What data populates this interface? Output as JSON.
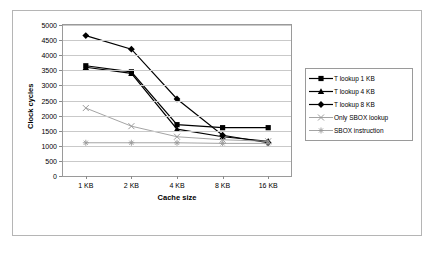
{
  "chart_data": {
    "type": "line",
    "title": "",
    "xlabel": "Cache size",
    "ylabel": "Clock cycles",
    "categories": [
      "1 KB",
      "2 KB",
      "4 KB",
      "8 KB",
      "16 KB"
    ],
    "ylim": [
      0,
      5000
    ],
    "yticks": [
      0,
      500,
      1000,
      1500,
      2000,
      2500,
      3000,
      3500,
      4000,
      4500,
      5000
    ],
    "grid": true,
    "legend_position": "right",
    "series": [
      {
        "name": "T lookup 1 KB",
        "marker": "square",
        "color": "#000000",
        "values": [
          3650,
          3450,
          1700,
          1600,
          1600
        ]
      },
      {
        "name": "T lookup 4 KB",
        "marker": "triangle",
        "color": "#000000",
        "values": [
          3600,
          3400,
          1550,
          1300,
          1150
        ]
      },
      {
        "name": "T lookup 8 KB",
        "marker": "diamond",
        "color": "#000000",
        "values": [
          4650,
          4200,
          2550,
          1350,
          1100
        ]
      },
      {
        "name": "Only SBOX lookup",
        "marker": "cross",
        "color": "#9a9a9a",
        "values": [
          2250,
          1650,
          1300,
          1200,
          1150
        ]
      },
      {
        "name": "SBOX instruction",
        "marker": "asterisk",
        "color": "#9a9a9a",
        "values": [
          1100,
          1100,
          1100,
          1080,
          1080
        ]
      }
    ]
  }
}
